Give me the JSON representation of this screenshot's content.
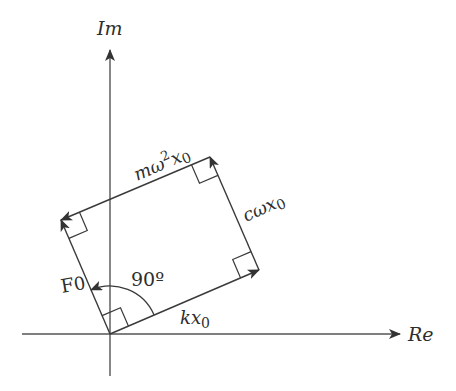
{
  "diagram": {
    "type": "phasor-diagram",
    "axes": {
      "imaginary_label": "Im",
      "real_label": "Re"
    },
    "phasors": {
      "spring_force": {
        "label_main": "kx",
        "label_sub": "0"
      },
      "damping_force": {
        "label_main": "cωx",
        "label_sub": "0"
      },
      "inertia_force": {
        "label_main": "mω",
        "label_sup": "2",
        "label_main2": "x",
        "label_sub": "0"
      },
      "excitation_force": {
        "label_main": "F",
        "label_sub": "0"
      }
    },
    "angle": {
      "label": "90º"
    },
    "colors": {
      "stroke": "#3a3a3a",
      "axis": "#555555",
      "text": "#2e2e2e",
      "background": "#ffffff"
    }
  }
}
